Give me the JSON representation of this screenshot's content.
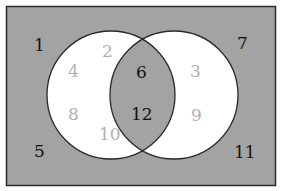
{
  "colors": {
    "background": "#a3a3a3",
    "circle_fill": "#ffffff",
    "intersection_fill": "#a3a3a3",
    "outline": "#2a2a2a",
    "dark_text": "#111111",
    "light_text": "#b0b0b0"
  },
  "universe": {
    "outside_numbers": [
      "1",
      "7",
      "5",
      "11"
    ]
  },
  "left_only": [
    "2",
    "4",
    "8",
    "10"
  ],
  "intersection": [
    "6",
    "12"
  ],
  "right_only": [
    "3",
    "9"
  ],
  "labels": {
    "n1": "1",
    "n2": "2",
    "n3": "3",
    "n4": "4",
    "n5": "5",
    "n6": "6",
    "n7": "7",
    "n8": "8",
    "n9": "9",
    "n10": "10",
    "n11": "11",
    "n12": "12"
  }
}
